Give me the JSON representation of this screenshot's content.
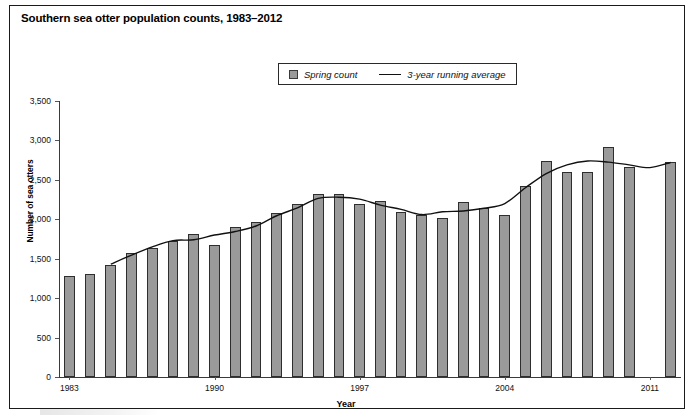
{
  "figure": {
    "title": "Southern sea otter population counts, 1983–2012",
    "width": 692,
    "height": 415,
    "border_color": "#1a1a1a"
  },
  "legend": {
    "position": "top-center",
    "entries": [
      {
        "label": "Spring count",
        "marker": "swatch",
        "color": "#9a9a9a"
      },
      {
        "label": "3-year running average",
        "marker": "line",
        "color": "#111111"
      }
    ]
  },
  "axes": {
    "ylabel": "Number of sea otters",
    "xlabel": "Year",
    "yticks": [
      "0",
      "500",
      "1,000",
      "1,500",
      "2,000",
      "2,500",
      "3,000",
      "3,500"
    ],
    "xticks": [
      "1983",
      "1990",
      "1997",
      "2004",
      "2011"
    ]
  },
  "chart_data": {
    "type": "bar",
    "title": "Southern sea otter population counts, 1983–2012",
    "xlabel": "Year",
    "ylabel": "Number of sea otters",
    "ylim": [
      0,
      3500
    ],
    "ytick_step": 500,
    "grid": false,
    "legend_position": "top-center",
    "categories": [
      "1983",
      "1984",
      "1985",
      "1986",
      "1987",
      "1988",
      "1989",
      "1990",
      "1991",
      "1992",
      "1993",
      "1994",
      "1995",
      "1996",
      "1997",
      "1998",
      "1999",
      "2000",
      "2001",
      "2002",
      "2003",
      "2004",
      "2005",
      "2006",
      "2007",
      "2008",
      "2009",
      "2010",
      "2011",
      "2012"
    ],
    "series": [
      {
        "name": "Spring count",
        "type": "bar",
        "color": "#9a9a9a",
        "values": [
          1277,
          1304,
          1419,
          1570,
          1640,
          1725,
          1815,
          1670,
          1900,
          1965,
          2075,
          2190,
          2315,
          2315,
          2200,
          2230,
          2090,
          2060,
          2020,
          2225,
          2140,
          2060,
          2420,
          2740,
          2600,
          2595,
          2920,
          2660,
          null,
          2730
        ]
      },
      {
        "name": "3-year running average",
        "type": "line",
        "color": "#111111",
        "values": [
          null,
          null,
          1430,
          1545,
          1650,
          1730,
          1740,
          1800,
          1845,
          1915,
          2045,
          2145,
          2265,
          2280,
          2255,
          2180,
          2125,
          2060,
          2095,
          2105,
          2140,
          2200,
          2400,
          2580,
          2690,
          2740,
          2725,
          2690,
          2655,
          2720
        ]
      }
    ]
  }
}
